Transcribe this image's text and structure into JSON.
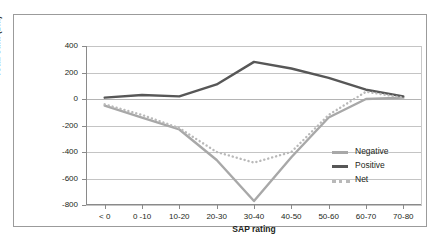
{
  "caption_remnant": "",
  "chart_data": {
    "type": "line",
    "title": "",
    "xlabel": "SAP rating",
    "ylabel": "Total sum (£m)",
    "categories": [
      "< 0",
      "0 -10",
      "10-20",
      "20-30",
      "30-40",
      "40-50",
      "50-60",
      "60-70",
      "70-80"
    ],
    "ylim": [
      -800,
      400
    ],
    "yticks": [
      400,
      200,
      0,
      -200,
      -400,
      -600,
      -800
    ],
    "ytick_labels": [
      "400",
      "200",
      "0",
      "-200",
      "-400",
      "-600",
      "-800"
    ],
    "grid": true,
    "legend_position": "inside-right",
    "series": [
      {
        "name": "Negative",
        "color": "#a8a8a8",
        "style": "solid",
        "values": [
          -50,
          -140,
          -230,
          -460,
          -770,
          -440,
          -140,
          0,
          10
        ]
      },
      {
        "name": "Positive",
        "color": "#575757",
        "style": "solid",
        "values": [
          10,
          30,
          20,
          110,
          280,
          230,
          160,
          70,
          20
        ]
      },
      {
        "name": "Net",
        "color": "#b9b9b9",
        "style": "dotted",
        "values": [
          -40,
          -120,
          -220,
          -400,
          -480,
          -400,
          -120,
          55,
          10
        ]
      }
    ]
  },
  "colors": {
    "negative": "#a8a8a8",
    "positive": "#575757",
    "net": "#b9b9b9",
    "grid": "#c4c4c4",
    "axis": "#8a8a8a",
    "frame": "#9b9b9b"
  }
}
